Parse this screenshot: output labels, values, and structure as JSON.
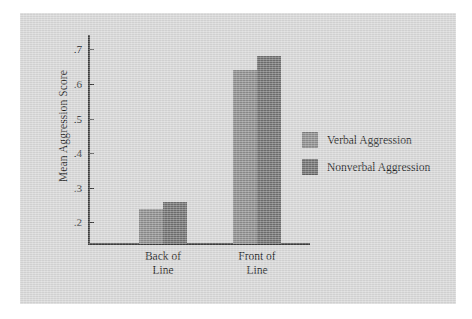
{
  "chart_data": {
    "type": "bar",
    "title": "",
    "xlabel": "",
    "ylabel": "Mean Aggression Score",
    "categories": [
      "Back of Line",
      "Front of Line"
    ],
    "category_lines": [
      [
        "Back of",
        "Line"
      ],
      [
        "Front of",
        "Line"
      ]
    ],
    "series": [
      {
        "name": "Verbal Aggression",
        "values": [
          0.24,
          0.64
        ],
        "color": "#8c8c8c"
      },
      {
        "name": "Nonverbal Aggression",
        "values": [
          0.26,
          0.68
        ],
        "color": "#6f6f6f"
      }
    ],
    "ylim": [
      0.14,
      0.74
    ],
    "yticks": [
      0.2,
      0.3,
      0.4,
      0.5,
      0.6,
      0.7
    ],
    "ytick_labels": [
      ".2",
      ".3",
      ".4",
      ".5",
      ".6",
      ".7"
    ],
    "grid": false,
    "legend_position": "right"
  },
  "axis": {
    "y_title": "Mean Aggression Score",
    "ticks": [
      {
        "label": ".7",
        "value": 0.7
      },
      {
        "label": ".6",
        "value": 0.6
      },
      {
        "label": ".5",
        "value": 0.5
      },
      {
        "label": ".4",
        "value": 0.4
      },
      {
        "label": ".3",
        "value": 0.3
      },
      {
        "label": ".2",
        "value": 0.2
      }
    ]
  },
  "groups": [
    {
      "line1": "Back of",
      "line2": "Line"
    },
    {
      "line1": "Front of",
      "line2": "Line"
    }
  ],
  "legend": {
    "items": [
      {
        "label": "Verbal Aggression",
        "color": "#8c8c8c"
      },
      {
        "label": "Nonverbal Aggression",
        "color": "#6f6f6f"
      }
    ]
  },
  "colors": {
    "panel_background": "#d6d6d6",
    "page_background": "#ffffff",
    "axis": "#3c3c3c",
    "text": "#1d1d1d"
  }
}
